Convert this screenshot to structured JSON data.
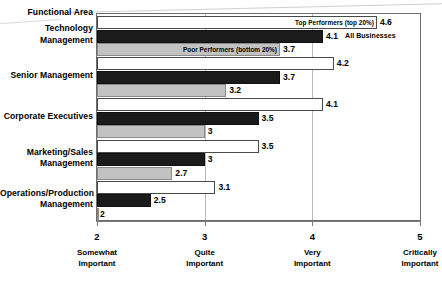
{
  "chart_data": {
    "type": "bar",
    "orientation": "horizontal",
    "title": "",
    "xlabel": "",
    "ylabel": "Functional Area",
    "xlim": [
      2,
      5
    ],
    "grid": true,
    "legend_position": "inline-annotation",
    "categories": [
      "Technology Management",
      "Senior Management",
      "Corporate Executives",
      "Marketing/Sales Management",
      "Operations/Production Management"
    ],
    "category_lines": [
      [
        "Technology",
        "Management"
      ],
      [
        "Senior Management"
      ],
      [
        "Corporate Executives"
      ],
      [
        "Marketing/Sales",
        "Management"
      ],
      [
        "Operations/Production",
        "Management"
      ]
    ],
    "series": [
      {
        "name": "Top Performers (top 20%)",
        "style": "white",
        "values": [
          4.6,
          4.2,
          4.1,
          3.5,
          3.1
        ],
        "labels": [
          "4.6",
          "4.2",
          "4.1",
          "3.5",
          "3.1"
        ]
      },
      {
        "name": "All Businesses",
        "style": "black",
        "values": [
          4.1,
          3.7,
          3.5,
          3.0,
          2.5
        ],
        "labels": [
          "4.1",
          "3.7",
          "3.5",
          "3",
          "2.5"
        ]
      },
      {
        "name": "Poor Performers (bottom 20%)",
        "style": "gray",
        "values": [
          3.7,
          3.2,
          3.0,
          2.7,
          2.0
        ],
        "labels": [
          "3.7",
          "3.2",
          "3",
          "2.7",
          "2"
        ]
      }
    ],
    "xticks": [
      {
        "value": 2,
        "label": "2",
        "desc_lines": [
          "Somewhat",
          "Important"
        ]
      },
      {
        "value": 3,
        "label": "3",
        "desc_lines": [
          "Quite",
          "Important"
        ]
      },
      {
        "value": 4,
        "label": "4",
        "desc_lines": [
          "Very",
          "Important"
        ]
      },
      {
        "value": 5,
        "label": "5",
        "desc_lines": [
          "Critically",
          "Important"
        ]
      }
    ],
    "annotations": [
      {
        "text": "Top Performers (top 20%)",
        "on_series": "Top Performers (top 20%)",
        "on_category": "Technology Management"
      },
      {
        "text": "All Businesses",
        "on_series": "All Businesses",
        "on_category": "Technology Management"
      },
      {
        "text": "Poor Performers (bottom 20%)",
        "on_series": "Poor Performers (bottom 20%)",
        "on_category": "Technology Management"
      }
    ]
  },
  "axis_header": "Functional Area"
}
